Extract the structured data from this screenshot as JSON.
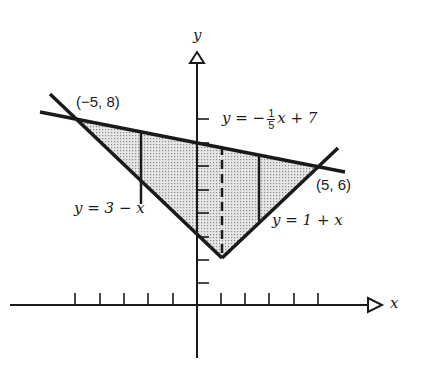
{
  "diagram": {
    "axes": {
      "x_label": "x",
      "y_label": "y",
      "x_ticks": [
        -5,
        -4,
        -3,
        -2,
        -1,
        1,
        2,
        3,
        4,
        5
      ],
      "y_ticks": [
        1,
        2,
        3,
        4,
        5,
        6,
        7,
        8
      ]
    },
    "lines": [
      {
        "label_parts": [
          "y = −",
          "1",
          "5",
          "x + 7"
        ],
        "equation": "y = -(1/5)x + 7"
      },
      {
        "label": "y = 3 − x",
        "equation": "y = 3 - x"
      },
      {
        "label": "y = 1 + x",
        "equation": "y = 1 + x"
      }
    ],
    "points": [
      {
        "label": "(−5, 8)",
        "x": -5,
        "y": 8
      },
      {
        "label": "(5, 6)",
        "x": 5,
        "y": 6
      },
      {
        "x": 1,
        "y": 2
      }
    ],
    "dashed_line_x": 1,
    "strip_lines_x": [
      -2.3,
      2.6
    ],
    "region": "shaded triangle bounded by the three lines",
    "colors": {
      "ink": "#1a1a1a",
      "shade": "#cfcfcf",
      "background": "#ffffff"
    }
  }
}
